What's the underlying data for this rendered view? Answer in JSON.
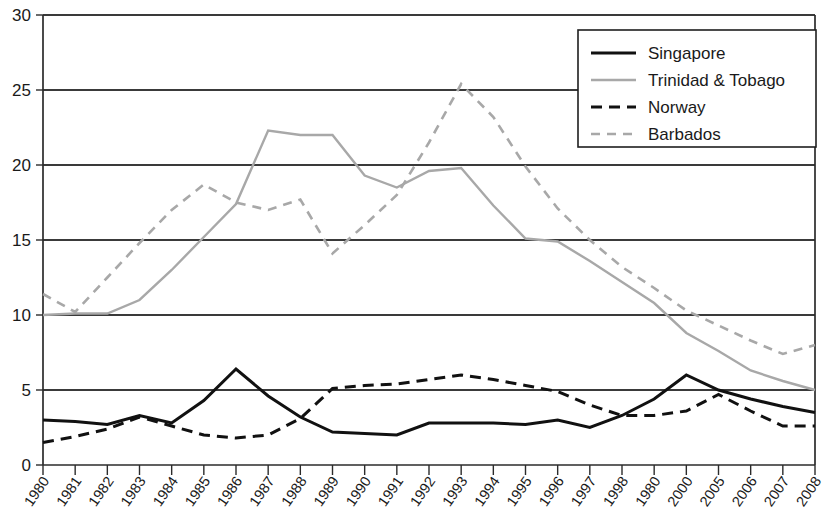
{
  "chart_data": {
    "type": "line",
    "title": "",
    "subtitle": "",
    "xlabel": "",
    "ylabel": "",
    "ylim": [
      0,
      30
    ],
    "ytick_values": [
      0,
      5,
      10,
      15,
      20,
      25,
      30
    ],
    "ytick_labels": [
      "0",
      "5",
      "10",
      "15",
      "20",
      "25",
      "30"
    ],
    "grid": true,
    "grid_axis": "y",
    "legend_position": "top-right",
    "categories": [
      "1980",
      "1981",
      "1982",
      "1983",
      "1984",
      "1985",
      "1986",
      "1987",
      "1988",
      "1989",
      "1990",
      "1991",
      "1992",
      "1993",
      "1994",
      "1995",
      "1996",
      "1997",
      "1998",
      "1980",
      "2000",
      "2005",
      "2006",
      "2007",
      "2008"
    ],
    "series": [
      {
        "name": "Singapore",
        "color": "#111111",
        "style": "solid",
        "width": 3.0,
        "values": [
          3.0,
          2.9,
          2.7,
          3.3,
          2.8,
          4.3,
          6.4,
          4.6,
          3.2,
          2.2,
          2.1,
          2.0,
          2.8,
          2.8,
          2.8,
          2.7,
          3.0,
          2.5,
          3.3,
          4.4,
          6.0,
          5.0,
          4.4,
          3.9,
          3.5
        ]
      },
      {
        "name": "Trinidad & Tobago",
        "color": "#a8a8a8",
        "style": "solid",
        "width": 2.4,
        "values": [
          10.0,
          10.1,
          10.1,
          11.0,
          13.0,
          15.2,
          17.4,
          22.3,
          22.0,
          22.0,
          19.3,
          18.5,
          19.6,
          19.8,
          17.3,
          15.1,
          14.9,
          13.6,
          12.2,
          10.8,
          8.8,
          7.6,
          6.3,
          5.6,
          5.0
        ]
      },
      {
        "name": "Norway",
        "color": "#111111",
        "style": "dashed",
        "width": 3.0,
        "values": [
          1.5,
          1.9,
          2.4,
          3.2,
          2.6,
          2.0,
          1.8,
          2.0,
          3.1,
          5.1,
          5.3,
          5.4,
          5.7,
          6.0,
          5.7,
          5.3,
          4.9,
          4.0,
          3.3,
          3.3,
          3.6,
          4.7,
          3.6,
          2.6,
          2.6
        ]
      },
      {
        "name": "Barbados",
        "color": "#a8a8a8",
        "style": "dashed",
        "width": 2.6,
        "values": [
          11.4,
          10.2,
          12.5,
          14.8,
          17.0,
          18.7,
          17.5,
          17.0,
          17.7,
          14.1,
          16.0,
          18.0,
          21.5,
          25.4,
          23.2,
          19.9,
          17.1,
          15.0,
          13.2,
          11.8,
          10.3,
          9.3,
          8.3,
          7.4,
          8.0
        ]
      }
    ]
  },
  "legend": {
    "items": [
      {
        "label": "Singapore"
      },
      {
        "label": "Trinidad & Tobago"
      },
      {
        "label": "Norway"
      },
      {
        "label": "Barbados"
      }
    ]
  }
}
